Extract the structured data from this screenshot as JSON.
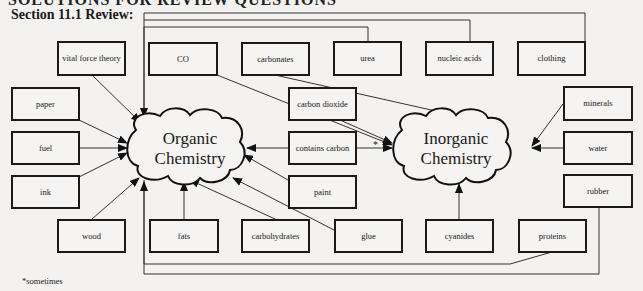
{
  "header": {
    "partial_title": "SOLUTIONS FOR REVIEW QUESTIONS",
    "section_title": "Section 11.1 Review:"
  },
  "clouds": {
    "organic": {
      "line1": "Organic",
      "line2": "Chemistry"
    },
    "inorganic": {
      "line1": "Inorganic",
      "line2": "Chemistry"
    }
  },
  "boxes": {
    "vital_force_theory": "vital force theory",
    "co": "CO",
    "carbonates": "carbonates",
    "urea": "urea",
    "nucleic_acids": "nucleic acids",
    "clothing": "clothing",
    "paper": "paper",
    "carbon_dioxide": "carbon dioxide",
    "minerals": "minerals",
    "fuel": "fuel",
    "contains_carbon": "contains carbon",
    "water": "water",
    "ink": "ink",
    "paint": "paint",
    "rubber": "rubber",
    "wood": "wood",
    "fats": "fats",
    "carbohydrates": "carbohydrates",
    "glue": "glue",
    "cyanides": "cyanides",
    "proteins": "proteins"
  },
  "annotations": {
    "star": "*",
    "footnote": "*sometimes"
  },
  "connections": {
    "organic_chemistry": [
      "vital force theory",
      "urea",
      "nucleic acids",
      "clothing",
      "paper",
      "fuel",
      "ink",
      "wood",
      "fats",
      "carbohydrates",
      "glue",
      "paint",
      "contains carbon",
      "proteins",
      "rubber"
    ],
    "inorganic_chemistry": [
      "CO",
      "carbonates",
      "carbon dioxide",
      "contains carbon (sometimes)",
      "minerals",
      "water",
      "cyanides"
    ]
  }
}
